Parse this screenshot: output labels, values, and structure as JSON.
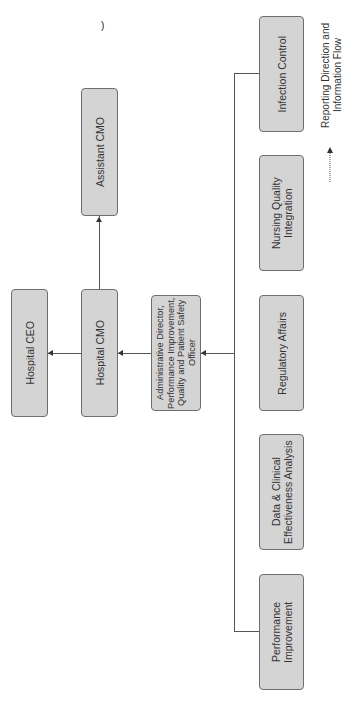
{
  "diagram": {
    "type": "organizational-chart",
    "orientation": "rotated-90-counterclockwise",
    "nodes": {
      "ceo": "Hospital CEO",
      "cmo": "Hospital CMO",
      "assistant_cmo": "Assistant CMO",
      "admin_director": "Administrative Director, Performance Improvement, Quality and Patient Safety Officer",
      "infection_control": "Infection Control",
      "nursing_quality": "Nursing Quality Integration",
      "regulatory": "Regulatory Affairs",
      "data_clinical": "Data & Clinical Effectiveness Analysis",
      "performance": "Performance Improvement"
    },
    "edges": [
      {
        "from": "cmo",
        "to": "ceo"
      },
      {
        "from": "cmo",
        "to": "assistant_cmo"
      },
      {
        "from": "admin_director",
        "to": "cmo"
      },
      {
        "from": "infection_control",
        "to": "admin_director"
      },
      {
        "from": "nursing_quality",
        "to": "admin_director"
      },
      {
        "from": "regulatory",
        "to": "admin_director"
      },
      {
        "from": "data_clinical",
        "to": "admin_director"
      },
      {
        "from": "performance",
        "to": "admin_director"
      }
    ],
    "legend": {
      "label": "Reporting Direction and Information Flow",
      "symbol": "dotted-arrow"
    },
    "colors": {
      "box_fill": "#d4d4d4",
      "box_border": "#6e6e6e",
      "line": "#555555"
    }
  },
  "stray_mark": ")"
}
